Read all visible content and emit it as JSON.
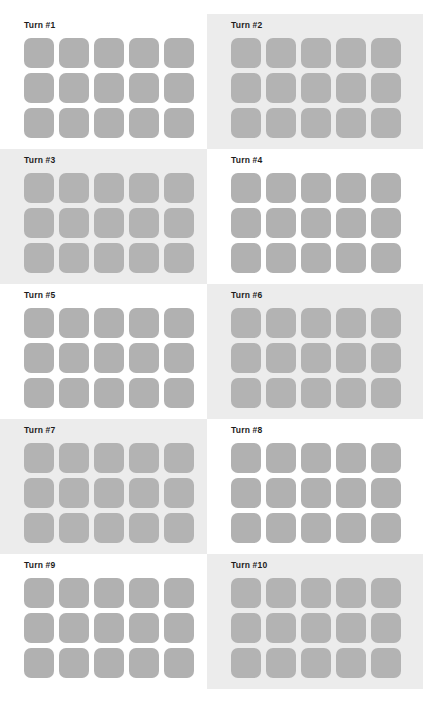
{
  "colors": {
    "page_background": "#ffffff",
    "panel_highlight_background": "#ececec",
    "tile": "#b1b1b1",
    "tile_highlight_panel": "#b3b3b3",
    "title_text": "#1d1d1d"
  },
  "grid": {
    "columns": 2,
    "rows": 5,
    "tile_columns": 5,
    "tile_rows": 3,
    "tiles_per_panel": 15
  },
  "panels": [
    {
      "title": "Turn #1",
      "highlighted": false,
      "tile_state": "empty"
    },
    {
      "title": "Turn #2",
      "highlighted": true,
      "tile_state": "empty"
    },
    {
      "title": "Turn #3",
      "highlighted": true,
      "tile_state": "empty"
    },
    {
      "title": "Turn #4",
      "highlighted": false,
      "tile_state": "empty"
    },
    {
      "title": "Turn #5",
      "highlighted": false,
      "tile_state": "empty"
    },
    {
      "title": "Turn #6",
      "highlighted": true,
      "tile_state": "empty"
    },
    {
      "title": "Turn #7",
      "highlighted": true,
      "tile_state": "empty"
    },
    {
      "title": "Turn #8",
      "highlighted": false,
      "tile_state": "empty"
    },
    {
      "title": "Turn #9",
      "highlighted": false,
      "tile_state": "empty"
    },
    {
      "title": "Turn #10",
      "highlighted": true,
      "tile_state": "empty"
    }
  ],
  "footer": {
    "caption": ""
  }
}
